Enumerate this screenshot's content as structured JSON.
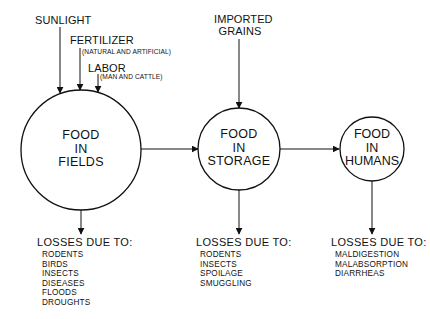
{
  "diagram": {
    "inputs": {
      "sunlight": "SUNLIGHT",
      "fertilizer": "FERTILIZER",
      "fertilizer_note": "(NATURAL AND ARTIFICIAL)",
      "labor": "LABOR",
      "labor_note": "(MAN AND CATTLE)",
      "imported_line1": "IMPORTED",
      "imported_line2": "GRAINS"
    },
    "nodes": [
      {
        "line1": "FOOD",
        "line2": "IN",
        "line3": "FIELDS"
      },
      {
        "line1": "FOOD",
        "line2": "IN",
        "line3": "STORAGE"
      },
      {
        "line1": "FOOD",
        "line2": "IN",
        "line3": "HUMANS"
      }
    ],
    "losses": [
      {
        "heading": "LOSSES DUE TO:",
        "items": [
          "RODENTS",
          "BIRDS",
          "INSECTS",
          "DISEASES",
          "FLOODS",
          "DROUGHTS"
        ]
      },
      {
        "heading": "LOSSES DUE TO:",
        "items": [
          "RODENTS",
          "INSECTS",
          "SPOILAGE",
          "SMUGGLING"
        ]
      },
      {
        "heading": "LOSSES DUE TO:",
        "items": [
          "MALDIGESTION",
          "MALABSORPTION",
          "DIARRHEAS"
        ]
      }
    ],
    "colors": {
      "ink": "#111111",
      "background": "#ffffff"
    }
  }
}
